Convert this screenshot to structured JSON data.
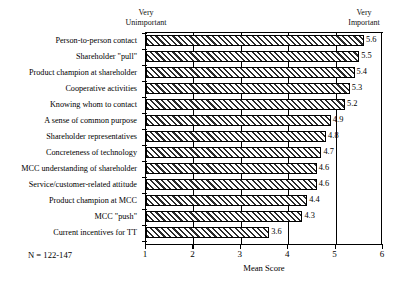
{
  "chart_data": {
    "type": "bar",
    "orientation": "horizontal",
    "title": "",
    "xlabel": "Mean Score",
    "ylabel": "",
    "xlim": [
      1,
      6
    ],
    "xticks": [
      1,
      2,
      3,
      4,
      5,
      6
    ],
    "grid": true,
    "grid_axis": "x",
    "legend": false,
    "categories": [
      "Person-to-person contact",
      "Shareholder \"pull\"",
      "Product champion at shareholder",
      "Cooperative activities",
      "Knowing whom to contact",
      "A sense of common purpose",
      "Shareholder representatives",
      "Concreteness of technology",
      "MCC understanding of shareholder",
      "Service/customer-related attitude",
      "Product champion at MCC",
      "MCC \"push\"",
      "Current incentives for TT"
    ],
    "values": [
      5.6,
      5.5,
      5.4,
      5.3,
      5.2,
      4.9,
      4.8,
      4.7,
      4.6,
      4.6,
      4.4,
      4.3,
      3.6
    ],
    "value_labels": [
      "5.6",
      "5.5",
      "5.4",
      "5.3",
      "5.2",
      "4.9",
      "4.8",
      "4.7",
      "4.6",
      "4.6",
      "4.4",
      "4.3",
      "3.6"
    ],
    "annotations": {
      "axis_low_caption": "Very\nUnimportant",
      "axis_high_caption": "Very\nImportant",
      "sample_size_note": "N = 122-147"
    },
    "bar_style": {
      "fill": "diagonal-hatch",
      "edge_color": "#000000",
      "face_color": "#ffffff"
    }
  },
  "tick_labels": {
    "t1": "1",
    "t2": "2",
    "t3": "3",
    "t4": "4",
    "t5": "5",
    "t6": "6"
  }
}
